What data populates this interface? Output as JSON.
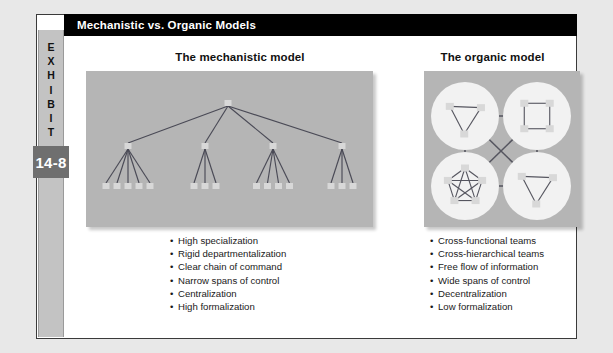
{
  "exhibit": {
    "label": "EXHIBIT",
    "number": "14-8"
  },
  "header": {
    "title": "Mechanistic vs. Organic Models",
    "background_color": "#000000",
    "text_color": "#ffffff"
  },
  "panels": {
    "mechanistic": {
      "heading": "The mechanistic model",
      "panel_color": "#b5b5b5",
      "node_color": "#d8d8d8",
      "line_color": "#4a4a56",
      "diagram": {
        "type": "hierarchy-tree",
        "root": {
          "x": 228,
          "y": 103
        },
        "managers": [
          {
            "x": 128,
            "y": 146,
            "subordinates": 5
          },
          {
            "x": 205,
            "y": 146,
            "subordinates": 3
          },
          {
            "x": 273,
            "y": 146,
            "subordinates": 4
          },
          {
            "x": 342,
            "y": 146,
            "subordinates": 3
          }
        ],
        "leaf_row_y": 186,
        "total_nodes": 20
      },
      "bullets": [
        "High specialization",
        "Rigid departmentalization",
        "Clear chain of command",
        "Narrow spans of control",
        "Centralization",
        "High formalization"
      ]
    },
    "organic": {
      "heading": "The organic model",
      "panel_color": "#b5b5b5",
      "circle_color": "#f2f2f2",
      "node_color": "#d8d8d8",
      "line_color": "#55555f",
      "diagram": {
        "type": "network-clusters",
        "clusters": [
          {
            "position": "top-left",
            "shape": "triangle",
            "nodes": 3
          },
          {
            "position": "top-right",
            "shape": "square",
            "nodes": 4
          },
          {
            "position": "bottom-left",
            "shape": "pentagon",
            "nodes": 5,
            "fully_connected": true
          },
          {
            "position": "bottom-right",
            "shape": "triangle",
            "nodes": 3
          }
        ],
        "inter_cluster_links": [
          "top-left—top-right",
          "bottom-left—bottom-right",
          "top-left—bottom-left",
          "top-right—bottom-right",
          "top-left—bottom-right",
          "top-right—bottom-left"
        ]
      },
      "bullets": [
        "Cross-functional teams",
        "Cross-hierarchical teams",
        "Free flow of information",
        "Wide spans of control",
        "Decentralization",
        "Low formalization"
      ]
    }
  }
}
